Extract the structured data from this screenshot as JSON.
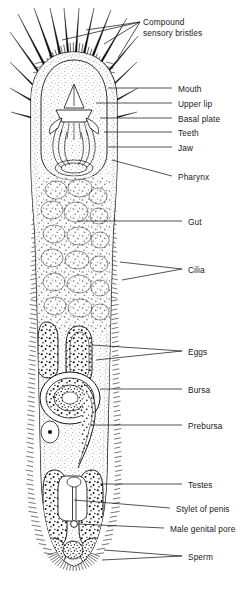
{
  "figure": {
    "organism_outline_color": "#111111",
    "background_color": "#ffffff",
    "line_color": "#111111",
    "stipple_color": "#222222"
  },
  "labels": [
    {
      "id": "compound-sensory-bristles",
      "text": "Compound\nsensory bristles",
      "x": 143,
      "y": 17,
      "leader": "fork3"
    },
    {
      "id": "mouth",
      "text": "Mouth",
      "x": 178,
      "y": 84,
      "leader": "line"
    },
    {
      "id": "upper-lip",
      "text": "Upper lip",
      "x": 178,
      "y": 99,
      "leader": "line"
    },
    {
      "id": "basal-plate",
      "text": "Basal plate",
      "x": 178,
      "y": 114,
      "leader": "line"
    },
    {
      "id": "teeth",
      "text": "Teeth",
      "x": 178,
      "y": 128,
      "leader": "line"
    },
    {
      "id": "jaw",
      "text": "Jaw",
      "x": 178,
      "y": 143,
      "leader": "line"
    },
    {
      "id": "pharynx",
      "text": "Pharynx",
      "x": 178,
      "y": 172,
      "leader": "slope"
    },
    {
      "id": "gut",
      "text": "Gut",
      "x": 188,
      "y": 217,
      "leader": "line"
    },
    {
      "id": "cilia",
      "text": "Cilia",
      "x": 188,
      "y": 265,
      "leader": "fork2"
    },
    {
      "id": "eggs",
      "text": "Eggs",
      "x": 188,
      "y": 347,
      "leader": "fork2"
    },
    {
      "id": "bursa",
      "text": "Bursa",
      "x": 188,
      "y": 385,
      "leader": "line"
    },
    {
      "id": "preursa",
      "text": "Prebursa",
      "x": 188,
      "y": 421,
      "leader": "line"
    },
    {
      "id": "testes",
      "text": "Testes",
      "x": 188,
      "y": 480,
      "leader": "line"
    },
    {
      "id": "stylet-of-penis",
      "text": "Stylet of penis",
      "x": 176,
      "y": 504,
      "leader": "line"
    },
    {
      "id": "male-genital-pore",
      "text": "Male genital pore",
      "x": 170,
      "y": 524,
      "leader": "line"
    },
    {
      "id": "sperm",
      "text": "Sperm",
      "x": 188,
      "y": 552,
      "leader": "fork2"
    }
  ],
  "anatomy": {
    "head": {
      "region": "anterior cephalic bulb",
      "features": [
        "compound sensory bristles",
        "ciliary coat"
      ]
    },
    "mouth_apparatus": {
      "parts": [
        "mouth",
        "upper lip",
        "basal plate",
        "teeth",
        "jaw"
      ]
    },
    "pharynx": {
      "position": "below jaw apparatus"
    },
    "gut": {
      "appearance": "broad stippled cellular mass filling midbody"
    },
    "cilia": {
      "appearance": "short hairs fringing the entire body wall"
    },
    "eggs": {
      "count": 2,
      "appearance": "oval bodies with coarse dark granules"
    },
    "bursa": {
      "appearance": "large oval with concentric rings and dense granules"
    },
    "preursa": {
      "appearance": "curved duct beneath the bursa"
    },
    "testes": {
      "count": 2,
      "appearance": "paired elongate granular sacs"
    },
    "stylet_of_penis": {
      "appearance": "slender median rod"
    },
    "male_genital_pore": {
      "position": "posterior ventral midline"
    },
    "sperm": {
      "appearance": "granular masses in posterior lobes"
    },
    "tail": {
      "appearance": "rounded posterior tip with radiating cilia"
    }
  }
}
